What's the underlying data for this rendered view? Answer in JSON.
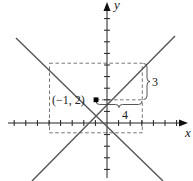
{
  "diagram": {
    "type": "coordinate-plane",
    "axes": {
      "x_label": "x",
      "y_label": "y",
      "x_ticks": [
        -8,
        -7,
        -6,
        -5,
        -4,
        -3,
        -2,
        -1,
        1,
        2,
        3,
        4,
        5,
        6
      ],
      "y_ticks": [
        -4,
        -3,
        -2,
        -1,
        1,
        2,
        3,
        4,
        5,
        6,
        7,
        8,
        9
      ]
    },
    "lines": [
      {
        "name": "ascending-line",
        "slope": 0.75,
        "intercept": 2.75,
        "equation": "y = 3/4 x + 11/4"
      },
      {
        "name": "descending-line",
        "slope": -0.75,
        "intercept": 1.25,
        "equation": "y = -3/4 x + 5/4"
      }
    ],
    "point": {
      "label": "(−1, 2)",
      "x": -1,
      "y": 2
    },
    "dashed_rectangle": {
      "x_min": -5,
      "x_max": 3,
      "y_min": -1,
      "y_max": 5
    },
    "rise_label": "3",
    "run_label": "4"
  }
}
